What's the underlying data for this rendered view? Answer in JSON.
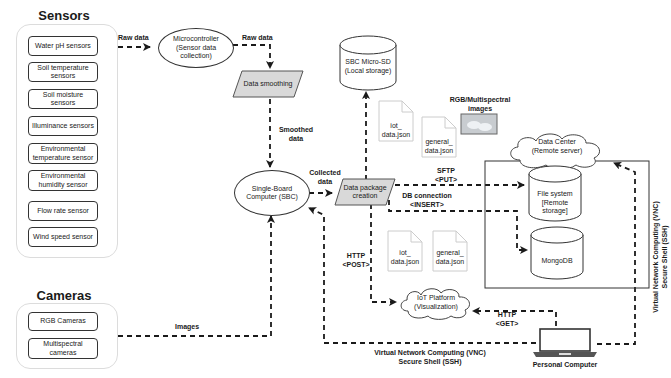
{
  "sensors": {
    "title": "Sensors",
    "items": [
      {
        "label": "Water pH sensors"
      },
      {
        "label": "Soil temperature sensors"
      },
      {
        "label": "Soil moisture sensors"
      },
      {
        "label": "Illuminance sensors"
      },
      {
        "label": "Environmental temperature sensor"
      },
      {
        "label": "Environmental humidity sensor"
      },
      {
        "label": "Flow rate sensor"
      },
      {
        "label": "Wind speed sensor"
      }
    ]
  },
  "cameras": {
    "title": "Cameras",
    "items": [
      {
        "label": "RGB Cameras"
      },
      {
        "label": "Multispectral cameras"
      }
    ]
  },
  "nodes": {
    "microcontroller": "Microcontroller (Sensor data collection)",
    "data_smoothing": "Data smoothing",
    "sbc": "Single-Board Computer (SBC)",
    "data_package": "Data package creation",
    "micro_sd": "SBC Micro-SD (Local storage)",
    "data_center": "Data Center (Remote server)",
    "file_system": "File system [Remote storage]",
    "mongodb": "MongoDB",
    "iot_platform": "IoT Platform (Visualization)",
    "personal_computer": "Personal Computer",
    "rgb_images": "RGB/Multispectral images"
  },
  "documents": {
    "top_iot": "iot_ data.json",
    "top_general": "general_ data.json",
    "bottom_iot": "iot_ data.json",
    "bottom_general": "general_ data.json"
  },
  "edges": {
    "raw_data_1": "Raw data",
    "raw_data_2": "Raw data",
    "smoothed_data": "Smoothed data",
    "collected_data": "Collected data",
    "images": "Images",
    "sftp": "SFTP <PUT>",
    "db_connection": "DB connection <INSERT>",
    "http_post": "HTTP <POST>",
    "http_get": "HTTP <GET>",
    "vnc_bottom_1": "Virtual Network Computing (VNC)",
    "vnc_bottom_2": "Secure Shell (SSH)",
    "vnc_right_1": "Virtual Network Computing (VNC)",
    "vnc_right_2": "Secure Shell (SSH)"
  },
  "colors": {
    "line": "#1a1a1a",
    "parallelogram_fill": "#d9d9d9",
    "group_border": "#dcdcdc"
  }
}
